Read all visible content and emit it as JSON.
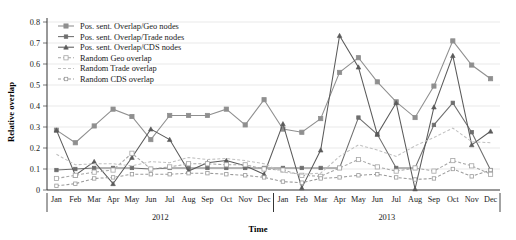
{
  "chart_data": {
    "type": "line",
    "title": "",
    "xlabel": "Time",
    "ylabel": "Relative overlap",
    "ylim": [
      0,
      0.8
    ],
    "ytick_step": 0.1,
    "yticks": [
      "0",
      "0.1",
      "0.2",
      "0.3",
      "0.4",
      "0.5",
      "0.6",
      "0.7",
      "0.8"
    ],
    "grid": true,
    "legend_position": "top-left",
    "x": [
      "Jan",
      "Feb",
      "Mar",
      "Apr",
      "May",
      "Jun",
      "Jul",
      "Aug",
      "Sep",
      "Oct",
      "Nov",
      "Dec",
      "Jan",
      "Feb",
      "Mar",
      "Apr",
      "May",
      "Jun",
      "Jul",
      "Aug",
      "Sep",
      "Oct",
      "Nov",
      "Dec"
    ],
    "x_groups": [
      {
        "label": "2012",
        "start": 0,
        "end": 11
      },
      {
        "label": "2013",
        "start": 12,
        "end": 23
      }
    ],
    "series": [
      {
        "name": "Pos. sent. Overlap/Geo nodes",
        "color": "#8f8f8f",
        "dash": "solid",
        "marker": "square",
        "values": [
          0.285,
          0.225,
          0.305,
          0.385,
          0.35,
          0.24,
          0.355,
          0.355,
          0.355,
          0.385,
          0.31,
          0.43,
          0.29,
          0.275,
          0.34,
          0.56,
          0.63,
          0.515,
          0.42,
          0.345,
          0.495,
          0.71,
          0.595,
          0.53
        ]
      },
      {
        "name": "Pos. sent. Overlap/Trade nodes",
        "color": "#6e6e6e",
        "dash": "solid",
        "marker": "small-square",
        "values": [
          0.095,
          0.1,
          0.105,
          0.105,
          0.105,
          0.1,
          0.105,
          0.105,
          0.105,
          0.105,
          0.105,
          0.105,
          0.105,
          0.105,
          0.105,
          0.105,
          0.345,
          0.265,
          0.105,
          0.105,
          0.31,
          0.415,
          0.275,
          0.095
        ]
      },
      {
        "name": "Pos. sent. Overlap/CDS nodes",
        "color": "#5a5a5a",
        "dash": "solid",
        "marker": "triangle",
        "values": [
          0.285,
          0.07,
          0.135,
          0.03,
          0.155,
          0.29,
          0.24,
          0.09,
          0.13,
          0.14,
          0.115,
          0.075,
          0.315,
          0.01,
          0.19,
          0.735,
          0.585,
          0.265,
          0.415,
          0.005,
          0.395,
          0.64,
          0.215,
          0.28
        ]
      },
      {
        "name": "Random Geo overlap",
        "color": "#a5a5a5",
        "dash": "dashed",
        "marker": "square-open",
        "values": [
          0.055,
          0.07,
          0.085,
          0.095,
          0.175,
          0.1,
          0.11,
          0.125,
          0.125,
          0.12,
          0.12,
          0.1,
          0.095,
          0.07,
          0.065,
          0.105,
          0.145,
          0.11,
          0.09,
          0.105,
          0.09,
          0.14,
          0.115,
          0.075
        ]
      },
      {
        "name": "Random Trade overlap",
        "color": "#c0c0c0",
        "dash": "dashed",
        "marker": "none",
        "values": [
          0.17,
          0.12,
          0.125,
          0.125,
          0.115,
          0.135,
          0.13,
          0.155,
          0.145,
          0.15,
          0.14,
          0.125,
          0.085,
          0.075,
          0.08,
          0.16,
          0.215,
          0.19,
          0.16,
          0.21,
          0.25,
          0.295,
          0.23,
          0.225
        ]
      },
      {
        "name": "Random CDS overlap",
        "color": "#9a9a9a",
        "dash": "dashed",
        "marker": "small-square-open",
        "values": [
          0.02,
          0.03,
          0.055,
          0.06,
          0.075,
          0.075,
          0.075,
          0.08,
          0.08,
          0.075,
          0.07,
          0.06,
          0.04,
          0.035,
          0.055,
          0.06,
          0.07,
          0.075,
          0.06,
          0.05,
          0.055,
          0.1,
          0.065,
          0.095
        ]
      }
    ]
  }
}
